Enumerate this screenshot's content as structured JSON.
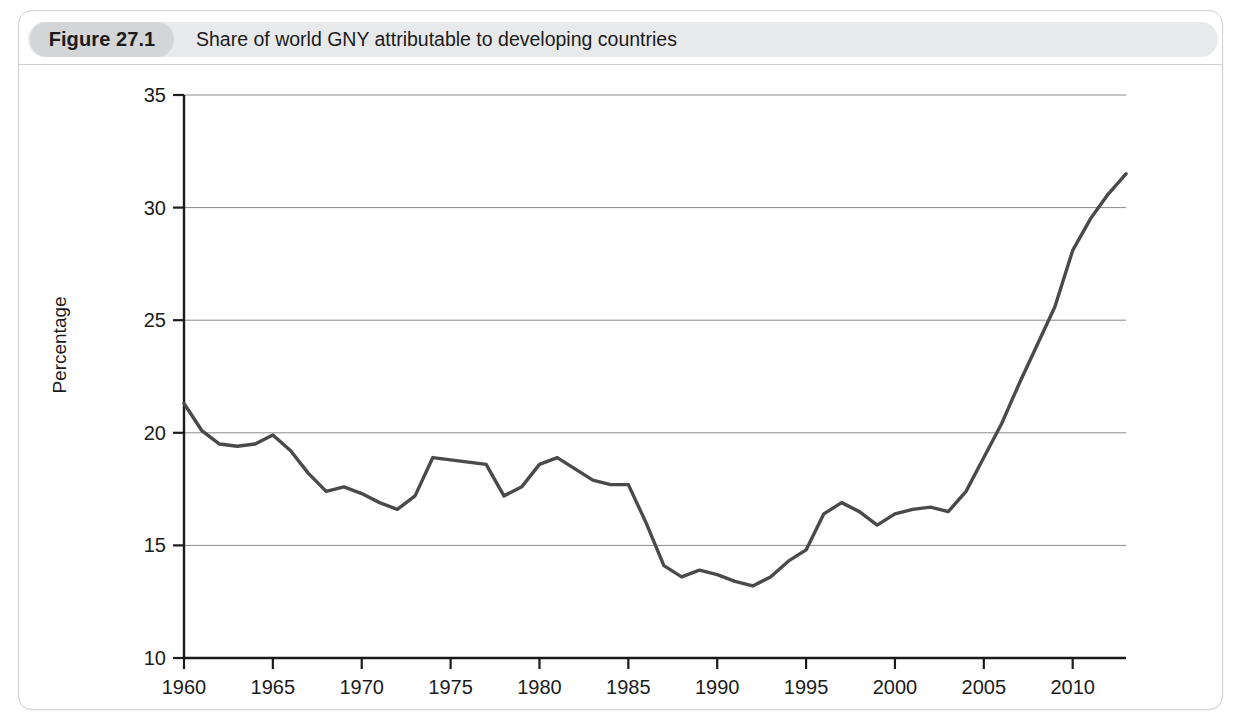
{
  "figure": {
    "badge_label": "Figure 27.1",
    "title": "Share of world GNY attributable to developing countries"
  },
  "colors": {
    "line": "#4a4a4a",
    "gridline": "#8a8a8a",
    "axis": "#1b1b1b",
    "badge_bg": "#d3d5d6",
    "header_bg": "#e8e9ea",
    "frame_border": "#cfd2d4"
  },
  "chart_data": {
    "type": "line",
    "title": "Share of world GNY attributable to developing countries",
    "xlabel": "",
    "ylabel": "Percentage",
    "xlim": [
      1960,
      2013
    ],
    "ylim": [
      10,
      35
    ],
    "yticks": [
      10,
      15,
      20,
      25,
      30,
      35
    ],
    "ytick_labels": [
      "10",
      "15",
      "20",
      "25",
      "30",
      "35"
    ],
    "xticks": [
      1960,
      1965,
      1970,
      1975,
      1980,
      1985,
      1990,
      1995,
      2000,
      2005,
      2010
    ],
    "xtick_labels": [
      "1960",
      "1965",
      "1970",
      "1975",
      "1980",
      "1985",
      "1990",
      "1995",
      "2000",
      "2005",
      "2010"
    ],
    "grid": true,
    "legend": null,
    "series": [
      {
        "name": "Share of world GNY attributable to developing countries",
        "x": [
          1960,
          1961,
          1962,
          1963,
          1964,
          1965,
          1966,
          1967,
          1968,
          1969,
          1970,
          1971,
          1972,
          1973,
          1974,
          1975,
          1976,
          1977,
          1978,
          1979,
          1980,
          1981,
          1982,
          1983,
          1984,
          1985,
          1986,
          1987,
          1988,
          1989,
          1990,
          1991,
          1992,
          1993,
          1994,
          1995,
          1996,
          1997,
          1998,
          1999,
          2000,
          2001,
          2002,
          2003,
          2004,
          2005,
          2006,
          2007,
          2008,
          2009,
          2010,
          2011,
          2012,
          2013
        ],
        "values": [
          21.3,
          20.1,
          19.5,
          19.4,
          19.5,
          19.9,
          19.2,
          18.2,
          17.4,
          17.6,
          17.3,
          16.9,
          16.6,
          17.2,
          18.9,
          18.8,
          18.7,
          18.6,
          17.2,
          17.6,
          18.6,
          18.9,
          18.4,
          17.9,
          17.7,
          17.7,
          16.0,
          14.1,
          13.6,
          13.9,
          13.7,
          13.4,
          13.2,
          13.6,
          14.3,
          14.8,
          16.4,
          16.9,
          16.5,
          15.9,
          16.4,
          16.6,
          16.7,
          16.5,
          17.4,
          18.9,
          20.4,
          22.2,
          23.9,
          25.6,
          28.1,
          29.5,
          30.6,
          31.5
        ]
      }
    ]
  }
}
